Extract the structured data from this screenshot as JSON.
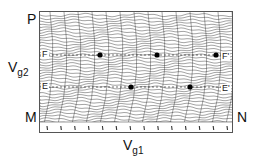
{
  "labels": {
    "top_left": "P",
    "bottom_left": "M",
    "bottom_right": "N",
    "y_axis": "V",
    "y_axis_sub": "g2",
    "x_axis": "V",
    "x_axis_sub": "g1",
    "line_f_left": "F",
    "line_f_right": "F'",
    "line_e_left": "E",
    "line_e_right": "E'"
  },
  "dots": [
    {
      "x": 60,
      "y": 43
    },
    {
      "x": 117,
      "y": 43
    },
    {
      "x": 176,
      "y": 43
    },
    {
      "x": 91,
      "y": 75
    },
    {
      "x": 150,
      "y": 75
    }
  ],
  "tick_count": 14,
  "colors": {
    "trace": "#333333",
    "dot": "#000000",
    "frame": "#555555"
  }
}
